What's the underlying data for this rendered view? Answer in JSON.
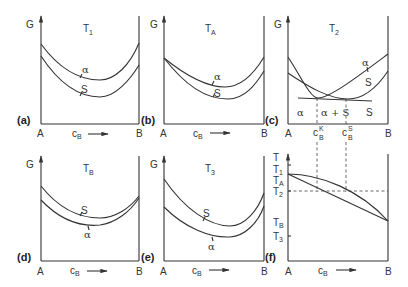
{
  "figure": {
    "axis_labels": {
      "y_gibbs": "G",
      "y_temp": "T",
      "x_left": "A",
      "x_right": "B",
      "x_var": "c",
      "x_var_sub": "B"
    },
    "panels": [
      {
        "id": "a",
        "label": "(a)",
        "temp": "T",
        "temp_sub": "1",
        "curve_top": "α",
        "curve_bottom": "S"
      },
      {
        "id": "b",
        "label": "(b)",
        "temp": "T",
        "temp_sub": "A",
        "curve_top": "α",
        "curve_bottom": "S"
      },
      {
        "id": "c",
        "label": "(c)",
        "temp": "T",
        "temp_sub": "2",
        "curve_alpha": "α",
        "curve_s": "S",
        "regions": [
          "α",
          "α + S",
          "S"
        ],
        "ck_label": "c",
        "ck_sub": "B",
        "ck_sup": "K",
        "cs_label": "c",
        "cs_sub": "B",
        "cs_sup": "S"
      },
      {
        "id": "d",
        "label": "(d)",
        "temp": "T",
        "temp_sub": "B",
        "curve_top": "S",
        "curve_bottom": "α"
      },
      {
        "id": "e",
        "label": "(e)",
        "temp": "T",
        "temp_sub": "3",
        "curve_top": "S",
        "curve_bottom": "α"
      },
      {
        "id": "f",
        "label": "(f)",
        "y_ticks": [
          {
            "t": "T",
            "sub": "1"
          },
          {
            "t": "T",
            "sub": "A"
          },
          {
            "t": "T",
            "sub": "2"
          },
          {
            "t": "T",
            "sub": "B"
          },
          {
            "t": "T",
            "sub": "3"
          }
        ]
      }
    ]
  }
}
